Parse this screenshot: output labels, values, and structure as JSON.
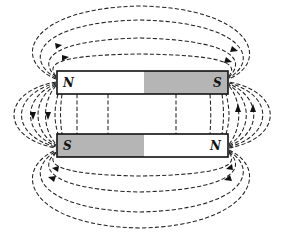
{
  "figure": {
    "colors": {
      "shaded_half": "#b5b5b5",
      "white_half": "#ffffff",
      "line": "#222222"
    },
    "magnets": [
      {
        "id": "top",
        "left_pole": "N",
        "right_pole": "S",
        "shaded_side": "right"
      },
      {
        "id": "bottom",
        "left_pole": "S",
        "right_pole": "N",
        "shaded_side": "left"
      }
    ],
    "field_line_style": "dashed",
    "arrow_directions": {
      "top_outer_loops": "left-to-right (N to S over the top)",
      "bottom_outer_loops": "right-to-left (N to S under the bottom)",
      "left_side_loops": "downward (top N to bottom S)",
      "right_side_loops": "upward (bottom N to top S)"
    }
  }
}
